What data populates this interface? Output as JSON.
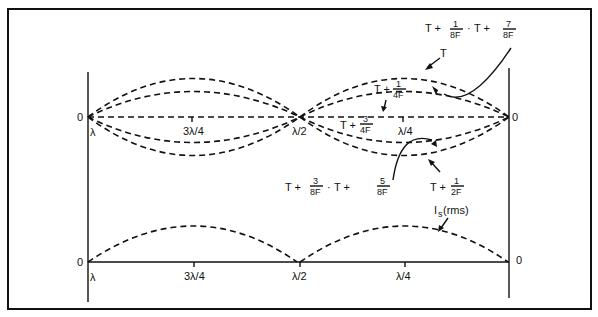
{
  "diagram": {
    "title": "",
    "top_plot": {
      "origin_left": "0",
      "origin_right": "0",
      "x_ticks": [
        "λ",
        "3λ/4",
        "λ/2",
        "λ/4"
      ],
      "curve_labels": {
        "T": "T",
        "T_1_4F": {
          "prefix": "T +",
          "num": "1",
          "den": "4F"
        },
        "T_3_4F": {
          "prefix": "T +",
          "num": "3",
          "den": "4F"
        },
        "T_1_2F": {
          "prefix": "T +",
          "num": "1",
          "den": "2F"
        },
        "T_1_8F_7_8F": {
          "prefix1": "T +",
          "num1": "1",
          "den1": "8F",
          "sep": "·",
          "prefix2": "T +",
          "num2": "7",
          "den2": "8F"
        },
        "T_3_8F_5_8F": {
          "prefix1": "T +",
          "num1": "3",
          "den1": "8F",
          "sep": "·",
          "prefix2": "T +",
          "num2": "5",
          "den2": "8F"
        }
      }
    },
    "bottom_plot": {
      "origin_left": "0",
      "origin_right": "0",
      "x_ticks": [
        "λ",
        "3λ/4",
        "λ/2",
        "λ/4"
      ],
      "curve_label": {
        "main": "I",
        "sub": "s",
        "suffix": "(rms)"
      }
    }
  }
}
